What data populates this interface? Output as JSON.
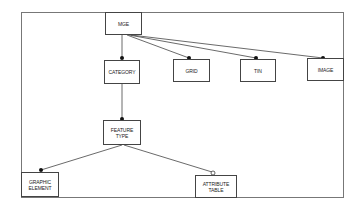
{
  "diagram": {
    "type": "entity-relationship hierarchy",
    "frame": {
      "x": 21,
      "y": 12,
      "w": 323,
      "h": 186
    },
    "nodes": [
      {
        "id": "mge",
        "label": "MGE",
        "x": 105,
        "y": 12,
        "w": 37,
        "h": 23
      },
      {
        "id": "category",
        "label": "CATEGORY",
        "x": 104,
        "y": 60,
        "w": 36,
        "h": 24
      },
      {
        "id": "grid",
        "label": "GRID",
        "x": 173,
        "y": 59,
        "w": 37,
        "h": 23
      },
      {
        "id": "tin",
        "label": "TIN",
        "x": 240,
        "y": 59,
        "w": 36,
        "h": 23
      },
      {
        "id": "image",
        "label": "IMAGE",
        "x": 307,
        "y": 58,
        "w": 37,
        "h": 23
      },
      {
        "id": "feature_type",
        "label": "FEATURE\nTYPE",
        "x": 103,
        "y": 120,
        "w": 38,
        "h": 25
      },
      {
        "id": "graphic_element",
        "label": "GRAPHIC\nELEMENT",
        "x": 21,
        "y": 172,
        "w": 38,
        "h": 25
      },
      {
        "id": "attribute_table",
        "label": "ATTRIBUTE\nTABLE",
        "x": 195,
        "y": 175,
        "w": 42,
        "h": 23
      }
    ],
    "edges": [
      {
        "from": "mge",
        "to": "category",
        "end": "filled-dot"
      },
      {
        "from": "mge",
        "to": "grid",
        "end": "filled-dot"
      },
      {
        "from": "mge",
        "to": "tin",
        "end": "filled-dot"
      },
      {
        "from": "mge",
        "to": "image",
        "end": "filled-dot"
      },
      {
        "from": "category",
        "to": "feature_type",
        "end": "filled-dot"
      },
      {
        "from": "feature_type",
        "to": "graphic_element",
        "end": "filled-dot"
      },
      {
        "from": "feature_type",
        "to": "attribute_table",
        "end": "open-circle"
      }
    ],
    "colors": {
      "line": "#444444",
      "dot": "#111111",
      "background": "#ffffff"
    }
  }
}
